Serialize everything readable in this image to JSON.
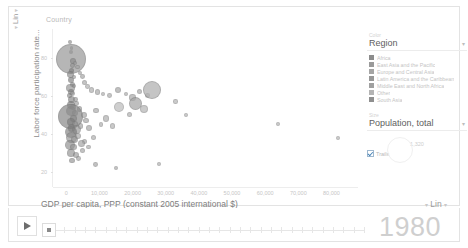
{
  "chart_data": {
    "type": "scatter",
    "title": "Country",
    "xlabel": "GDP per capita, PPP (constant 2005 international $)",
    "ylabel": "Labor force participation rate...",
    "xlim": [
      -4000,
      88000
    ],
    "ylim": [
      12,
      95
    ],
    "x_ticks": [
      "0",
      "10,000",
      "20,000",
      "30,000",
      "40,000",
      "50,000",
      "60,000",
      "70,000",
      "80,000"
    ],
    "x_tick_values": [
      0,
      10000,
      20000,
      30000,
      40000,
      50000,
      60000,
      70000,
      80000
    ],
    "y_ticks": [
      "80",
      "60",
      "40",
      "20"
    ],
    "y_tick_values": [
      80,
      60,
      40,
      20
    ],
    "x_scale": "Lin",
    "y_scale": "Lin",
    "grid": false,
    "legend_position": "right",
    "size_encoding": "Population, total",
    "color_encoding": "Region",
    "year": "1980",
    "points": [
      {
        "x": 1200,
        "y": 88,
        "r": 2.0,
        "c": "#8e8e8e"
      },
      {
        "x": 1700,
        "y": 85,
        "r": 1.6,
        "c": "#8a8a8a"
      },
      {
        "x": 1500,
        "y": 83,
        "r": 2.2,
        "c": "#7e7e7e"
      },
      {
        "x": 1400,
        "y": 79,
        "r": 15.0,
        "c": "#9a9a9a"
      },
      {
        "x": 2000,
        "y": 78,
        "r": 3.0,
        "c": "#888888"
      },
      {
        "x": 1900,
        "y": 76,
        "r": 2.4,
        "c": "#909090"
      },
      {
        "x": 2600,
        "y": 77,
        "r": 2.0,
        "c": "#9d9d9d"
      },
      {
        "x": 3400,
        "y": 75,
        "r": 2.2,
        "c": "#a4a4a4"
      },
      {
        "x": 1600,
        "y": 73,
        "r": 2.6,
        "c": "#7c7c7c"
      },
      {
        "x": 1300,
        "y": 71,
        "r": 3.4,
        "c": "#828282"
      },
      {
        "x": 2200,
        "y": 70,
        "r": 2.0,
        "c": "#9a9a9a"
      },
      {
        "x": 4200,
        "y": 72,
        "r": 2.2,
        "c": "#a0a0a0"
      },
      {
        "x": 4800,
        "y": 70,
        "r": 2.4,
        "c": "#9c9c9c"
      },
      {
        "x": 1500,
        "y": 68,
        "r": 3.0,
        "c": "#767676"
      },
      {
        "x": 1800,
        "y": 66,
        "r": 2.6,
        "c": "#818181"
      },
      {
        "x": 1200,
        "y": 64,
        "r": 4.4,
        "c": "#8c8c8c"
      },
      {
        "x": 2400,
        "y": 65,
        "r": 2.2,
        "c": "#999999"
      },
      {
        "x": 5600,
        "y": 67,
        "r": 2.6,
        "c": "#a2a2a2"
      },
      {
        "x": 6400,
        "y": 65,
        "r": 2.4,
        "c": "#a8a8a8"
      },
      {
        "x": 1400,
        "y": 62,
        "r": 3.2,
        "c": "#7a7a7a"
      },
      {
        "x": 1100,
        "y": 60,
        "r": 2.6,
        "c": "#888888"
      },
      {
        "x": 2000,
        "y": 61,
        "r": 2.4,
        "c": "#949494"
      },
      {
        "x": 7600,
        "y": 63,
        "r": 2.6,
        "c": "#a6a6a6"
      },
      {
        "x": 9400,
        "y": 62,
        "r": 2.8,
        "c": "#a0a0a0"
      },
      {
        "x": 11000,
        "y": 61,
        "r": 2.2,
        "c": "#aaaaaa"
      },
      {
        "x": 1600,
        "y": 58,
        "r": 3.6,
        "c": "#7e7e7e"
      },
      {
        "x": 2800,
        "y": 58,
        "r": 2.4,
        "c": "#969696"
      },
      {
        "x": 13000,
        "y": 60,
        "r": 2.4,
        "c": "#a4a4a4"
      },
      {
        "x": 15500,
        "y": 63,
        "r": 3.0,
        "c": "#9c9c9c"
      },
      {
        "x": 18000,
        "y": 61,
        "r": 2.2,
        "c": "#a6a6a6"
      },
      {
        "x": 1300,
        "y": 55,
        "r": 4.0,
        "c": "#757575"
      },
      {
        "x": 2100,
        "y": 54,
        "r": 2.8,
        "c": "#8e8e8e"
      },
      {
        "x": 3200,
        "y": 56,
        "r": 2.4,
        "c": "#989898"
      },
      {
        "x": 20000,
        "y": 59,
        "r": 3.2,
        "c": "#9e9e9e"
      },
      {
        "x": 22000,
        "y": 62,
        "r": 2.6,
        "c": "#a2a2a2"
      },
      {
        "x": 24500,
        "y": 60,
        "r": 2.4,
        "c": "#a8a8a8"
      },
      {
        "x": 1500,
        "y": 52,
        "r": 5.2,
        "c": "#808080"
      },
      {
        "x": 2600,
        "y": 51,
        "r": 3.0,
        "c": "#8a8a8a"
      },
      {
        "x": 4000,
        "y": 53,
        "r": 2.6,
        "c": "#949494"
      },
      {
        "x": 26000,
        "y": 63,
        "r": 9.0,
        "c": "#b0b0b0"
      },
      {
        "x": 1200,
        "y": 49,
        "r": 12.5,
        "c": "#8b8b8b"
      },
      {
        "x": 2300,
        "y": 48,
        "r": 3.4,
        "c": "#868686"
      },
      {
        "x": 5200,
        "y": 50,
        "r": 3.0,
        "c": "#9a9a9a"
      },
      {
        "x": 9000,
        "y": 52,
        "r": 2.6,
        "c": "#a2a2a2"
      },
      {
        "x": 16000,
        "y": 54,
        "r": 5.0,
        "c": "#b2b2b2"
      },
      {
        "x": 21000,
        "y": 56,
        "r": 6.5,
        "c": "#a6a6a6"
      },
      {
        "x": 23500,
        "y": 53,
        "r": 4.0,
        "c": "#aaaaaa"
      },
      {
        "x": 1400,
        "y": 46,
        "r": 4.2,
        "c": "#7b7b7b"
      },
      {
        "x": 2700,
        "y": 45,
        "r": 3.0,
        "c": "#909090"
      },
      {
        "x": 6000,
        "y": 47,
        "r": 2.8,
        "c": "#9e9e9e"
      },
      {
        "x": 12000,
        "y": 48,
        "r": 3.2,
        "c": "#a4a4a4"
      },
      {
        "x": 19000,
        "y": 50,
        "r": 2.6,
        "c": "#a8a8a8"
      },
      {
        "x": 1600,
        "y": 43,
        "r": 3.6,
        "c": "#848484"
      },
      {
        "x": 3000,
        "y": 42,
        "r": 4.6,
        "c": "#8e8e8e"
      },
      {
        "x": 1300,
        "y": 41,
        "r": 6.0,
        "c": "#797979"
      },
      {
        "x": 4400,
        "y": 44,
        "r": 2.6,
        "c": "#9c9c9c"
      },
      {
        "x": 7000,
        "y": 43,
        "r": 3.0,
        "c": "#a0a0a0"
      },
      {
        "x": 10500,
        "y": 45,
        "r": 2.4,
        "c": "#a6a6a6"
      },
      {
        "x": 14000,
        "y": 44,
        "r": 2.8,
        "c": "#aaaaaa"
      },
      {
        "x": 1500,
        "y": 38,
        "r": 5.4,
        "c": "#8d8d8d"
      },
      {
        "x": 2500,
        "y": 37,
        "r": 3.4,
        "c": "#979797"
      },
      {
        "x": 3600,
        "y": 39,
        "r": 3.0,
        "c": "#9f9f9f"
      },
      {
        "x": 5400,
        "y": 36,
        "r": 2.6,
        "c": "#a3a3a3"
      },
      {
        "x": 8200,
        "y": 38,
        "r": 2.8,
        "c": "#a7a7a7"
      },
      {
        "x": 1200,
        "y": 34,
        "r": 4.8,
        "c": "#868686"
      },
      {
        "x": 2200,
        "y": 33,
        "r": 3.2,
        "c": "#929292"
      },
      {
        "x": 4600,
        "y": 35,
        "r": 3.6,
        "c": "#9b9b9b"
      },
      {
        "x": 6800,
        "y": 33,
        "r": 2.4,
        "c": "#a5a5a5"
      },
      {
        "x": 1400,
        "y": 30,
        "r": 3.8,
        "c": "#8a8a8a"
      },
      {
        "x": 2900,
        "y": 29,
        "r": 3.0,
        "c": "#969696"
      },
      {
        "x": 5000,
        "y": 31,
        "r": 2.6,
        "c": "#a0a0a0"
      },
      {
        "x": 3800,
        "y": 27,
        "r": 2.4,
        "c": "#9e9e9e"
      },
      {
        "x": 1800,
        "y": 26,
        "r": 2.8,
        "c": "#8e8e8e"
      },
      {
        "x": 33000,
        "y": 57,
        "r": 2.2,
        "c": "#ababab"
      },
      {
        "x": 36000,
        "y": 50,
        "r": 2.0,
        "c": "#aeaeae"
      },
      {
        "x": 64000,
        "y": 45,
        "r": 2.0,
        "c": "#b0b0b0"
      },
      {
        "x": 82000,
        "y": 38,
        "r": 2.0,
        "c": "#b2b2b2"
      },
      {
        "x": 28000,
        "y": 24,
        "r": 2.0,
        "c": "#acacac"
      },
      {
        "x": 15000,
        "y": 22,
        "r": 2.2,
        "c": "#a4a4a4"
      },
      {
        "x": 8800,
        "y": 24,
        "r": 2.4,
        "c": "#9d9d9d"
      }
    ]
  },
  "chart": {
    "country_label": "Country",
    "y_axis_title": "Labor force participation rate...",
    "y_scale_label": "Lin",
    "x_axis_title": "GDP per capita, PPP (constant 2005 international $)",
    "x_scale_label": "Lin"
  },
  "legend": {
    "color_caption": "Color",
    "color_selected": "Region",
    "regions": [
      {
        "label": "Africa",
        "color": "#8c8c8c"
      },
      {
        "label": "East Asia and the Pacific",
        "color": "#9a9a9a"
      },
      {
        "label": "Europe and Central Asia",
        "color": "#a5a5a5"
      },
      {
        "label": "Latin America and the Caribbean",
        "color": "#989898"
      },
      {
        "label": "Middle East and North Africa",
        "color": "#a0a0a0"
      },
      {
        "label": "Other",
        "color": "#b4b4b4"
      },
      {
        "label": "South Asia",
        "color": "#8f8f8f"
      }
    ],
    "size_caption": "Size",
    "size_selected": "Population, total",
    "size_value": "1,320",
    "trails_label": "Trails",
    "trails_checked": true
  },
  "player": {
    "play_label": "Play",
    "year": "1980"
  }
}
